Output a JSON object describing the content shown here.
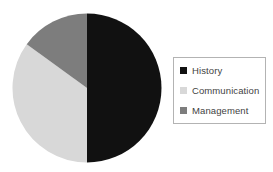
{
  "chart_data": {
    "type": "pie",
    "title": "",
    "subtitle": "",
    "xlabel": "",
    "ylabel": "",
    "categories": [
      "History",
      "Communication",
      "Management"
    ],
    "values": [
      50,
      35,
      15
    ],
    "unit": "%",
    "colors": [
      "#111111",
      "#d8d8d8",
      "#7d7d7d"
    ],
    "start_angle_deg": 0,
    "direction": "clockwise",
    "grid": false,
    "legend_position": "right",
    "annotations": [],
    "slices": [
      {
        "label": "History",
        "value": 50,
        "color": "#111111",
        "start_deg": 0,
        "end_deg": 180
      },
      {
        "label": "Communication",
        "value": 35,
        "color": "#d8d8d8",
        "start_deg": 180,
        "end_deg": 306
      },
      {
        "label": "Management",
        "value": 15,
        "color": "#7d7d7d",
        "start_deg": 306,
        "end_deg": 360
      }
    ]
  },
  "legend": {
    "items": [
      {
        "label": "History",
        "color": "#111111"
      },
      {
        "label": "Communication",
        "color": "#d8d8d8"
      },
      {
        "label": "Management",
        "color": "#7d7d7d"
      }
    ],
    "border_color": "#b3b3b3",
    "text_color": "#3f3f3f"
  },
  "canvas": {
    "background": "#ffffff"
  }
}
